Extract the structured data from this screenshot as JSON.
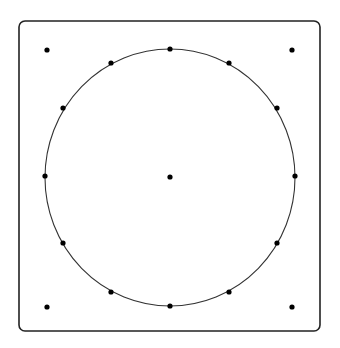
{
  "diagram": {
    "frame": {
      "x": 19,
      "y": 21,
      "width": 301,
      "height": 310,
      "radius": 6,
      "stroke": "#222222"
    },
    "circle": {
      "cx": 170,
      "cy": 177.5,
      "rx": 125,
      "ry": 128.5,
      "stroke": "#333333"
    },
    "center_point": {
      "x": 170,
      "y": 177
    },
    "circle_points": [
      {
        "x": 170,
        "y": 49
      },
      {
        "x": 229,
        "y": 63
      },
      {
        "x": 277,
        "y": 108
      },
      {
        "x": 295,
        "y": 176
      },
      {
        "x": 277,
        "y": 243
      },
      {
        "x": 229,
        "y": 292
      },
      {
        "x": 170,
        "y": 306
      },
      {
        "x": 111,
        "y": 292
      },
      {
        "x": 63,
        "y": 243
      },
      {
        "x": 45,
        "y": 176
      },
      {
        "x": 63,
        "y": 108
      },
      {
        "x": 111,
        "y": 63
      }
    ],
    "corner_points": [
      {
        "x": 47,
        "y": 50
      },
      {
        "x": 292,
        "y": 50
      },
      {
        "x": 47,
        "y": 307
      },
      {
        "x": 292,
        "y": 307
      }
    ],
    "point_color": "#000000",
    "point_radius": 2.6
  }
}
